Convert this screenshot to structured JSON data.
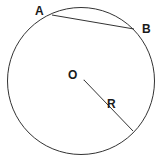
{
  "diagram": {
    "labels": {
      "point_a": "A",
      "point_b": "B",
      "center": "O",
      "radius": "R"
    },
    "colors": {
      "stroke": "#333333",
      "text": "#1a1a1a",
      "background": "#ffffff"
    }
  }
}
